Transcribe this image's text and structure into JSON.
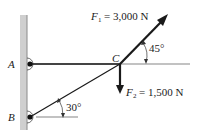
{
  "diagram": {
    "points": {
      "A": "A",
      "B": "B",
      "C": "C"
    },
    "forces": {
      "F1": {
        "symbol": "F",
        "subscript": "1",
        "value": "= 3,000 N",
        "angle": "45°"
      },
      "F2": {
        "symbol": "F",
        "subscript": "2",
        "value": "= 1,500 N"
      }
    },
    "angles": {
      "member_BC": "30°"
    },
    "colors": {
      "wall": "#c8c8c8",
      "wall_edge": "#8a8a8a",
      "line": "#1a1a1a"
    }
  }
}
